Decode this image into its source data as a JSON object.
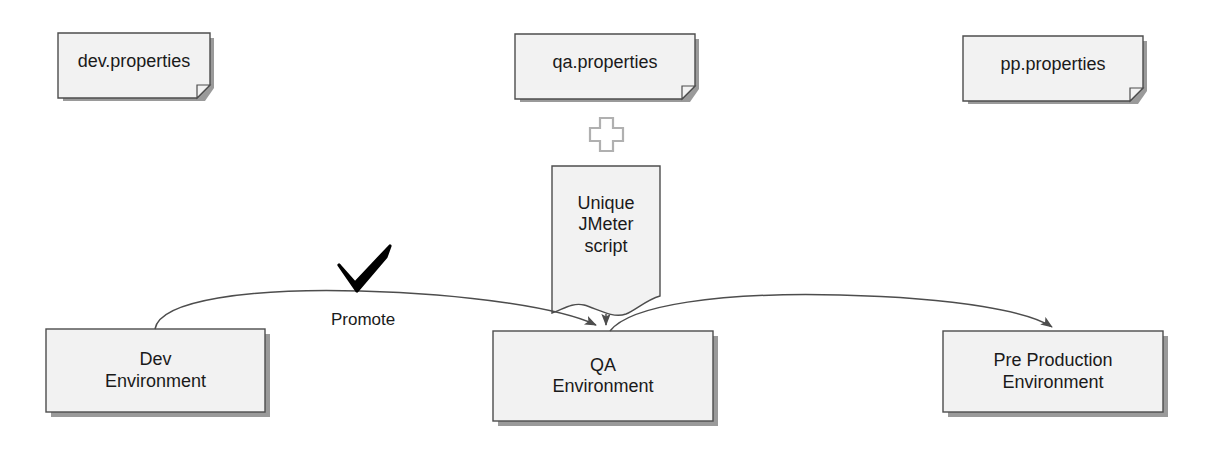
{
  "diagram": {
    "notes": [
      {
        "id": "dev-properties",
        "label": "dev.properties"
      },
      {
        "id": "qa-properties",
        "label": "qa.properties"
      },
      {
        "id": "pp-properties",
        "label": "pp.properties"
      }
    ],
    "script_node": {
      "id": "unique-jmeter-script",
      "label": "Unique\nJMeter\nscript"
    },
    "operator": {
      "id": "plus-operator",
      "symbol": "+"
    },
    "environments": [
      {
        "id": "dev-environment",
        "label": "Dev\nEnvironment"
      },
      {
        "id": "qa-environment",
        "label": "QA\nEnvironment"
      },
      {
        "id": "pp-environment",
        "label": "Pre Production\nEnvironment"
      }
    ],
    "edges": [
      {
        "id": "dev-to-qa",
        "label": "Promote"
      },
      {
        "id": "qa-to-pp",
        "label": ""
      },
      {
        "id": "script-to-qa",
        "label": ""
      }
    ],
    "marks": [
      {
        "id": "approval-check",
        "symbol": "✔"
      }
    ],
    "colors": {
      "shape_fill": "#f2f2f2",
      "shape_stroke": "#4d4d4d",
      "shadow": "#999999",
      "edge_stroke": "#4d4d4d",
      "text": "#1a1a1a",
      "operator_stroke": "#b3b3b3",
      "check_mark": "#000000"
    }
  }
}
